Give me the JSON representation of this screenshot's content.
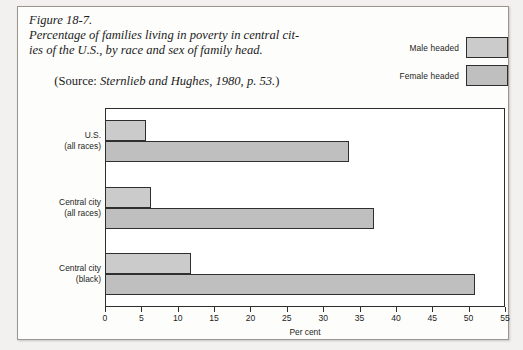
{
  "caption": {
    "figure_number": "Figure 18-7.",
    "line1": "Percentage of families living in poverty in central cit-",
    "line2": "ies of the U.S., by race and sex of family head.",
    "source_prefix": "(Source: ",
    "source_text": "Sternlieb and Hughes, 1980, p. 53.",
    "source_suffix": ")"
  },
  "legend": {
    "items": [
      {
        "label": "Male headed",
        "color": "#cbcbcb"
      },
      {
        "label": "Female headed",
        "color": "#bfbfbf"
      }
    ]
  },
  "chart_data": {
    "type": "bar",
    "orientation": "horizontal",
    "xlabel": "Per cent",
    "ylabel": "",
    "xlim": [
      0,
      55
    ],
    "xticks": [
      0,
      5,
      10,
      15,
      20,
      25,
      30,
      35,
      40,
      45,
      50,
      55
    ],
    "grid": false,
    "legend_position": "top-right",
    "categories": [
      {
        "line1": "U.S.",
        "line2": "(all races)"
      },
      {
        "line1": "Central city",
        "line2": "(all races)"
      },
      {
        "line1": "Central city",
        "line2": "(black)"
      }
    ],
    "series": [
      {
        "name": "Male headed",
        "color": "#cbcbcb",
        "values": [
          5.6,
          6.3,
          11.8
        ]
      },
      {
        "name": "Female headed",
        "color": "#bfbfbf",
        "values": [
          33.5,
          37.0,
          50.9
        ]
      }
    ]
  }
}
